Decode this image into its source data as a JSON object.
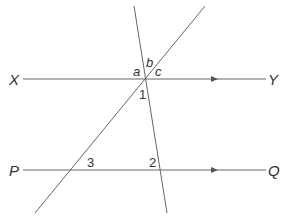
{
  "diagram": {
    "type": "parallel lines cut by transversals",
    "lines": {
      "top_parallel": {
        "start_label": "X",
        "end_label": "Y"
      },
      "bottom_parallel": {
        "start_label": "P",
        "end_label": "Q"
      }
    },
    "angle_labels": {
      "a": "a",
      "b": "b",
      "c": "c",
      "one": "1",
      "two": "2",
      "three": "3"
    },
    "colors": {
      "line": "#555555",
      "text": "#333333"
    }
  }
}
